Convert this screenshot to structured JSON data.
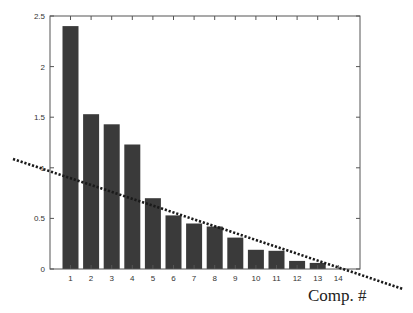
{
  "chart_data": {
    "type": "bar",
    "title": "",
    "xlabel": "Comp. #",
    "ylabel": "",
    "categories": [
      "1",
      "2",
      "3",
      "4",
      "5",
      "6",
      "7",
      "8",
      "9",
      "10",
      "11",
      "12",
      "13",
      "14"
    ],
    "values": [
      2.4,
      1.53,
      1.43,
      1.23,
      0.7,
      0.53,
      0.45,
      0.42,
      0.31,
      0.19,
      0.18,
      0.08,
      0.06,
      0.0
    ],
    "ylim": [
      0,
      2.5
    ],
    "yticks": [
      0,
      0.5,
      1,
      1.5,
      2,
      2.5
    ],
    "ytick_labels": [
      "0",
      "0.5",
      "1",
      "1.5",
      "2",
      "2.5"
    ],
    "grid": false,
    "bar_color": "#3a3a3a",
    "annotations": [
      {
        "type": "dotted-line",
        "description": "scree elbow trend line",
        "from_px": [
          13,
          159
        ],
        "to_px": [
          403,
          289
        ],
        "color": "#1a1a1a"
      }
    ],
    "legend": null
  }
}
